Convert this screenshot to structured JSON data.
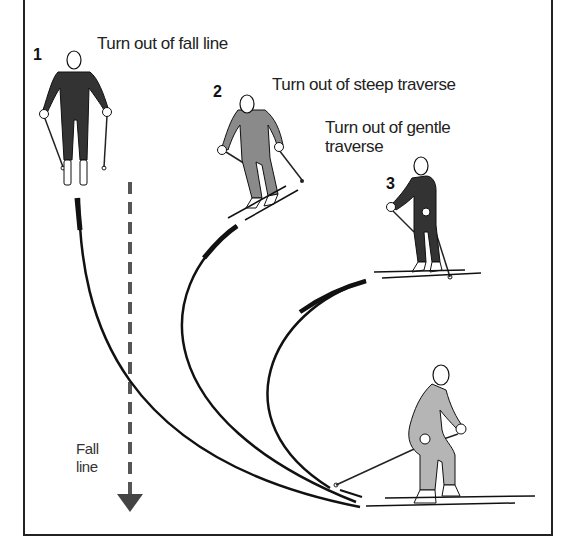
{
  "diagram": {
    "labels": {
      "turn1": "Turn out of fall line",
      "turn2": "Turn out of steep traverse",
      "turn3_line1": "Turn out of gentle",
      "turn3_line2": "traverse",
      "fall_line_1": "Fall",
      "fall_line_2": "line"
    },
    "numbers": [
      "1",
      "2",
      "3"
    ],
    "colors": {
      "frame": "#222222",
      "track": "#111111",
      "dark_suit": "#333333",
      "grey_suit": "#8a8a8a",
      "light_suit": "#b5b5b5",
      "fall_line": "#555555"
    }
  }
}
